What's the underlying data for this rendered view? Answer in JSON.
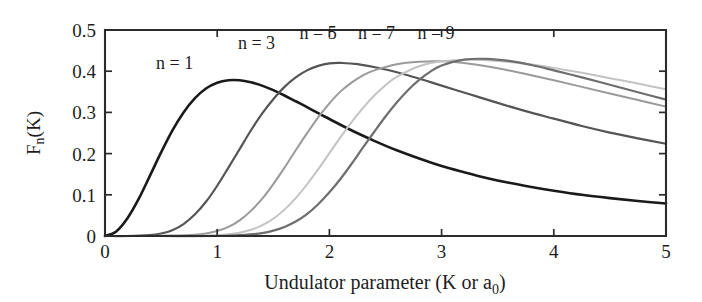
{
  "chart_data": {
    "type": "line",
    "title": "",
    "xlabel": "Undulator parameter (K or a₀)",
    "xlabel_main": "Undulator parameter (K or a",
    "xlabel_sub": "0",
    "xlabel_tail": ")",
    "ylabel": "Fₙ(K)",
    "ylabel_main": "F",
    "ylabel_sub": "n",
    "ylabel_tail": "(K)",
    "xlim": [
      0,
      5
    ],
    "ylim": [
      0,
      0.5
    ],
    "xticks": [
      0,
      1,
      2,
      3,
      4,
      5
    ],
    "xtick_labels": [
      "0",
      "1",
      "2",
      "3",
      "4",
      "5"
    ],
    "yticks": [
      0,
      0.1,
      0.2,
      0.3,
      0.4,
      0.5
    ],
    "ytick_labels": [
      "0",
      "0.1",
      "0.2",
      "0.3",
      "0.4",
      "0.5"
    ],
    "grid": false,
    "legend_position": "inline-annotations",
    "series": [
      {
        "name": "n = 1",
        "color": "#1a1a1a",
        "width": 2.6,
        "peak_x": 1.2,
        "peak_y": 0.378,
        "label_x": 0.62,
        "label_y": 0.405,
        "x": [
          0.0,
          0.1,
          0.2,
          0.3,
          0.4,
          0.5,
          0.6,
          0.7,
          0.8,
          0.9,
          1.0,
          1.1,
          1.2,
          1.3,
          1.4,
          1.5,
          1.6,
          1.7,
          1.8,
          1.9,
          2.0,
          2.2,
          2.4,
          2.6,
          2.8,
          3.0,
          3.2,
          3.4,
          3.6,
          3.8,
          4.0,
          4.25,
          4.5,
          4.75,
          5.0
        ],
        "y": [
          0.0,
          0.011,
          0.043,
          0.09,
          0.146,
          0.203,
          0.256,
          0.3,
          0.334,
          0.358,
          0.372,
          0.378,
          0.378,
          0.373,
          0.365,
          0.354,
          0.341,
          0.327,
          0.313,
          0.298,
          0.284,
          0.256,
          0.231,
          0.208,
          0.188,
          0.17,
          0.155,
          0.141,
          0.129,
          0.119,
          0.11,
          0.1,
          0.092,
          0.085,
          0.079
        ]
      },
      {
        "name": "n = 3",
        "color": "#555555",
        "width": 2.2,
        "peak_x": 1.85,
        "peak_y": 0.42,
        "label_x": 1.35,
        "label_y": 0.455,
        "x": [
          0.0,
          0.2,
          0.4,
          0.5,
          0.6,
          0.7,
          0.8,
          0.9,
          1.0,
          1.1,
          1.2,
          1.3,
          1.4,
          1.5,
          1.6,
          1.7,
          1.8,
          1.9,
          2.0,
          2.1,
          2.25,
          2.5,
          2.75,
          3.0,
          3.25,
          3.5,
          3.75,
          4.0,
          4.25,
          4.5,
          4.75,
          5.0
        ],
        "y": [
          0.0,
          0.0,
          0.002,
          0.006,
          0.014,
          0.029,
          0.052,
          0.083,
          0.122,
          0.166,
          0.211,
          0.256,
          0.297,
          0.332,
          0.362,
          0.385,
          0.402,
          0.413,
          0.419,
          0.42,
          0.417,
          0.404,
          0.386,
          0.365,
          0.344,
          0.323,
          0.303,
          0.285,
          0.267,
          0.251,
          0.237,
          0.224
        ]
      },
      {
        "name": "n = 5",
        "color": "#9a9a9a",
        "width": 2.0,
        "peak_x": 2.2,
        "peak_y": 0.425,
        "label_x": 1.9,
        "label_y": 0.478,
        "x": [
          0.0,
          0.3,
          0.6,
          0.8,
          0.9,
          1.0,
          1.1,
          1.2,
          1.3,
          1.4,
          1.5,
          1.6,
          1.7,
          1.8,
          1.9,
          2.0,
          2.1,
          2.2,
          2.3,
          2.4,
          2.6,
          2.8,
          3.0,
          3.25,
          3.5,
          3.75,
          4.0,
          4.25,
          4.5,
          4.75,
          5.0
        ],
        "y": [
          0.0,
          0.0,
          0.001,
          0.003,
          0.006,
          0.012,
          0.022,
          0.038,
          0.061,
          0.09,
          0.126,
          0.166,
          0.208,
          0.249,
          0.288,
          0.322,
          0.351,
          0.373,
          0.39,
          0.402,
          0.417,
          0.423,
          0.424,
          0.418,
          0.407,
          0.393,
          0.378,
          0.362,
          0.346,
          0.33,
          0.314
        ]
      },
      {
        "name": "n = 7",
        "color": "#c3c3c3",
        "width": 2.0,
        "peak_x": 2.5,
        "peak_y": 0.428,
        "label_x": 2.42,
        "label_y": 0.478,
        "x": [
          0.0,
          0.4,
          0.8,
          1.0,
          1.1,
          1.2,
          1.3,
          1.4,
          1.5,
          1.6,
          1.7,
          1.8,
          1.9,
          2.0,
          2.1,
          2.2,
          2.3,
          2.4,
          2.5,
          2.6,
          2.8,
          3.0,
          3.25,
          3.5,
          3.75,
          4.0,
          4.25,
          4.5,
          4.75,
          5.0
        ],
        "y": [
          0.0,
          0.0,
          0.0,
          0.002,
          0.004,
          0.008,
          0.015,
          0.026,
          0.042,
          0.064,
          0.092,
          0.125,
          0.162,
          0.201,
          0.24,
          0.277,
          0.311,
          0.341,
          0.366,
          0.386,
          0.412,
          0.424,
          0.428,
          0.425,
          0.418,
          0.408,
          0.396,
          0.383,
          0.37,
          0.356
        ]
      },
      {
        "name": "n = 9",
        "color": "#6e6e6e",
        "width": 2.2,
        "peak_x": 2.8,
        "peak_y": 0.43,
        "label_x": 2.95,
        "label_y": 0.478,
        "x": [
          0.0,
          0.5,
          1.0,
          1.2,
          1.3,
          1.4,
          1.5,
          1.6,
          1.7,
          1.8,
          1.9,
          2.0,
          2.1,
          2.2,
          2.3,
          2.4,
          2.5,
          2.6,
          2.7,
          2.8,
          2.9,
          3.0,
          3.2,
          3.4,
          3.6,
          3.8,
          4.0,
          4.25,
          4.5,
          4.75,
          5.0
        ],
        "y": [
          0.0,
          0.0,
          0.0,
          0.002,
          0.004,
          0.007,
          0.013,
          0.022,
          0.035,
          0.053,
          0.077,
          0.106,
          0.139,
          0.176,
          0.215,
          0.253,
          0.29,
          0.324,
          0.354,
          0.379,
          0.399,
          0.414,
          0.428,
          0.43,
          0.425,
          0.415,
          0.402,
          0.385,
          0.367,
          0.349,
          0.331
        ]
      }
    ]
  },
  "figure": {
    "plot_left": 105,
    "plot_right": 666,
    "plot_top": 30,
    "plot_bottom": 236
  }
}
